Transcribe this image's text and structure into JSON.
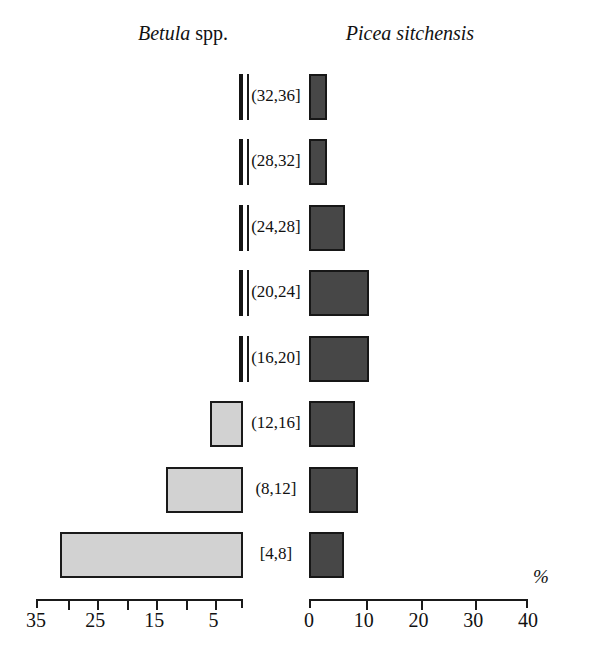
{
  "figure": {
    "left_panel_title_italic": "Betula",
    "left_panel_title_roman": " spp.",
    "right_panel_title": "Picea sitchensis",
    "unit_label": "%"
  },
  "chart_data": {
    "type": "bar",
    "title": "",
    "orientation": "horizontal",
    "layout": "back-to-back (population pyramid), categories centered between panels",
    "categories": [
      "[4,8]",
      "(8,12]",
      "(12,16]",
      "(16,20]",
      "(20,24]",
      "(24,28]",
      "(28,32]",
      "(32,36]"
    ],
    "category_order_top_to_bottom": [
      "(32,36]",
      "(28,32]",
      "(24,28]",
      "(20,24]",
      "(16,20]",
      "(12,16]",
      "(8,12]",
      "[4,8]"
    ],
    "xlabel": "%",
    "ylabel": "",
    "grid": false,
    "legend": false,
    "series": [
      {
        "name": "Betula spp.",
        "panel": "left",
        "direction": "right-to-left",
        "color": "#d2d2d2",
        "edge_color": "#1a1a1a",
        "axis_label": "%",
        "axis_reversed": true,
        "xlim": [
          35,
          0
        ],
        "ticks": [
          35,
          30,
          25,
          20,
          15,
          10,
          5,
          0
        ],
        "tick_labels": [
          "35",
          "",
          "25",
          "",
          "15",
          "",
          "5",
          ""
        ],
        "values_top_to_bottom": [
          0,
          0,
          0,
          0.2,
          0,
          5.6,
          13.0,
          31.0
        ],
        "values": [
          31.0,
          13.0,
          5.6,
          0,
          0.2,
          0,
          0,
          0
        ]
      },
      {
        "name": "Picea sitchensis",
        "panel": "right",
        "direction": "left-to-right",
        "color": "#474747",
        "edge_color": "#171717",
        "axis_label": "%",
        "axis_reversed": false,
        "xlim": [
          0,
          40
        ],
        "ticks": [
          0,
          10,
          20,
          30,
          40
        ],
        "tick_labels": [
          "0",
          "10",
          "20",
          "30",
          "40"
        ],
        "values_top_to_bottom": [
          3.3,
          3.3,
          6.5,
          11.0,
          11.0,
          8.4,
          9.0,
          6.4
        ],
        "values": [
          6.4,
          9.0,
          8.4,
          11.0,
          11.0,
          6.5,
          3.3,
          3.3
        ]
      }
    ]
  },
  "axes": {
    "left": {
      "tick_labels": [
        {
          "text": "35",
          "value": 35
        },
        {
          "text": "25",
          "value": 25
        },
        {
          "text": "15",
          "value": 15
        },
        {
          "text": "5",
          "value": 5
        }
      ]
    },
    "right": {
      "tick_labels": [
        {
          "text": "0",
          "value": 0
        },
        {
          "text": "10",
          "value": 10
        },
        {
          "text": "20",
          "value": 20
        },
        {
          "text": "30",
          "value": 30
        },
        {
          "text": "40",
          "value": 40
        }
      ]
    }
  }
}
